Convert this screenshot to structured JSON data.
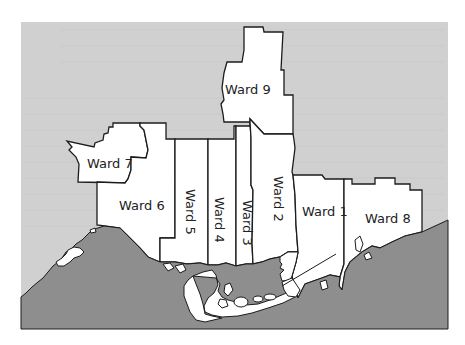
{
  "map": {
    "title": "",
    "colors": {
      "page_background": "#ffffff",
      "land_background": "#d0d0d0",
      "water": "#8e8e8e",
      "ward_fill": "#ffffff",
      "border": "#1c1c1c"
    },
    "wards": [
      {
        "id": "ward-1",
        "label": "Ward 1"
      },
      {
        "id": "ward-2",
        "label": "Ward 2"
      },
      {
        "id": "ward-3",
        "label": "Ward 3"
      },
      {
        "id": "ward-4",
        "label": "Ward 4"
      },
      {
        "id": "ward-5",
        "label": "Ward 5"
      },
      {
        "id": "ward-6",
        "label": "Ward 6"
      },
      {
        "id": "ward-7",
        "label": "Ward 7"
      },
      {
        "id": "ward-8",
        "label": "Ward 8"
      },
      {
        "id": "ward-9",
        "label": "Ward 9"
      }
    ]
  }
}
